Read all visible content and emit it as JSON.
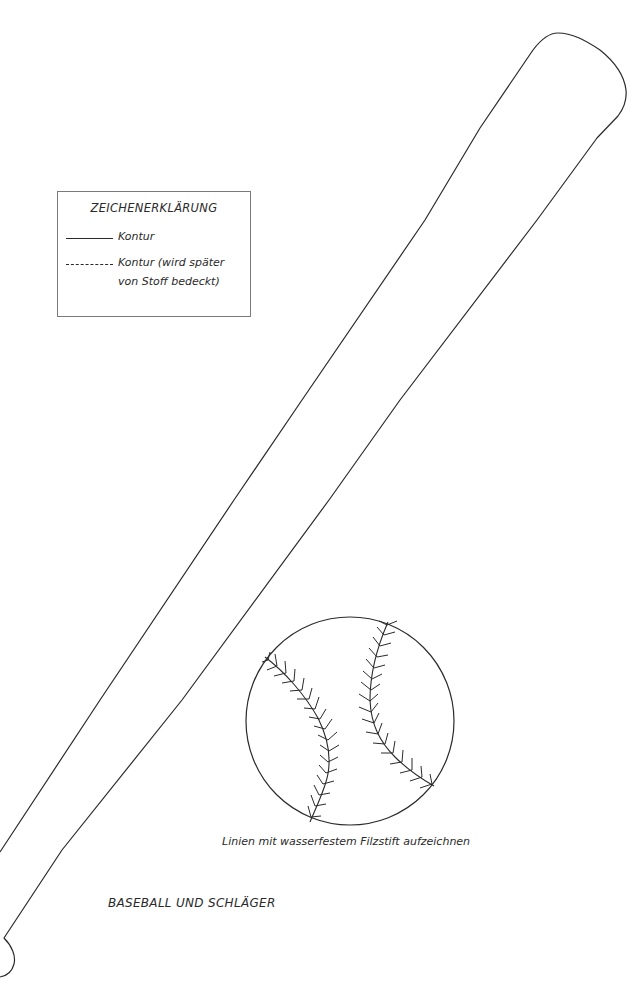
{
  "legend": {
    "title": "ZEICHENERKLÄRUNG",
    "items": [
      {
        "style": "solid",
        "label": "Kontur"
      },
      {
        "style": "dashed",
        "label": "Kontur (wird später",
        "label_line2": "von Stoff bedeckt)"
      }
    ]
  },
  "ball": {
    "caption": "Linien mit wasserfestem Filzstift aufzeichnen"
  },
  "page": {
    "title": "BASEBALL UND SCHLÄGER"
  },
  "colors": {
    "stroke": "#2a2a2a",
    "legend_border": "#7a7a7a",
    "background": "#ffffff"
  }
}
